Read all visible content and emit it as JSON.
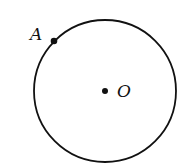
{
  "diagram": {
    "type": "circle-with-points",
    "circle": {
      "cx": 105,
      "cy": 91,
      "r": 71,
      "stroke": "#111111"
    },
    "points": [
      {
        "id": "A",
        "label": "A",
        "x": 54,
        "y": 41,
        "on_circle": true
      },
      {
        "id": "O",
        "label": "O",
        "x": 105,
        "y": 91,
        "is_center": true
      }
    ]
  },
  "labels": {
    "point_a": "A",
    "point_o": "O"
  }
}
